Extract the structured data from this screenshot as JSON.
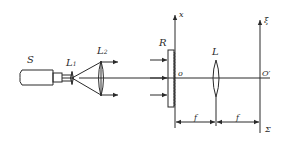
{
  "figure": {
    "type": "optical-setup-schematic",
    "colors": {
      "ink": "#2a2a2a",
      "background": "#ffffff"
    },
    "labels": {
      "source": "S",
      "lens1": "L",
      "lens1_sub": "1",
      "lens2": "L",
      "lens2_sub": "2",
      "object": "R",
      "x_axis": "x",
      "origin": "o",
      "lens": "L",
      "xi_axis": "ξ",
      "origin_prime": "O′",
      "focal1": "f",
      "focal2": "f",
      "plane": "Σ"
    }
  }
}
